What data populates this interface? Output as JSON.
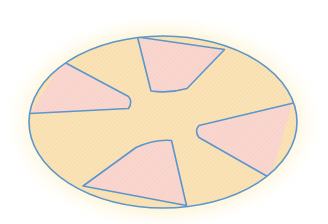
{
  "figure": {
    "title": "Ellipse divided into five pink sectors",
    "background_color": "#ffffff",
    "glow_color": "#fdf0c4",
    "stroke_color": "#5b96cc",
    "stroke_width": 1.6,
    "disk_fill": "#fae3b6",
    "sector_fill": "#fad6d2",
    "hatch_color": "#f3cf9a",
    "hatch_angle_deg": 45
  },
  "ellipse": {
    "label": "outer-ellipse",
    "cx": 163,
    "cy": 122,
    "rx": 134,
    "ry": 86,
    "left": 29,
    "right": 297,
    "top": 36,
    "bottom": 208
  },
  "hub": {
    "label": "central-hub",
    "description": "open yellow region at center where sector apexes stop",
    "approx_radius": 38
  },
  "sectors": [
    {
      "name": "sector-top",
      "fill": "#fad6d2",
      "arc_start_deg": 255,
      "arc_end_deg": 293,
      "apex": [
        168,
        92
      ],
      "points": "138,39 151,91 186,89 224,50"
    },
    {
      "name": "sector-upper-left",
      "fill": "#fad6d2",
      "arc_start_deg": 162,
      "arc_end_deg": 208,
      "apex": [
        128,
        101
      ],
      "points": "63,62 128,97 129,107 31,113"
    },
    {
      "name": "sector-right",
      "fill": "#fad6d2",
      "arc_start_deg": 340,
      "arc_end_deg": 58,
      "apex": [
        199,
        130
      ],
      "points": "292,103 199,126 198,136 270,177"
    },
    {
      "name": "sector-bottom",
      "fill": "#fad6d2",
      "arc_start_deg": 78,
      "arc_end_deg": 122,
      "apex": [
        154,
        142
      ],
      "points": "136,147 171,140 185,203 85,186"
    },
    {
      "name": "sector-upper-right-gap",
      "fill": "#fae3b6",
      "note": "yellow gap wedge between top and right sectors"
    }
  ],
  "chart_data": {
    "type": "pie",
    "categories": [
      "sector-top",
      "sector-upper-left",
      "sector-right",
      "sector-bottom",
      "gap-regions"
    ],
    "values": [
      14,
      16,
      18,
      16,
      36
    ],
    "colors": [
      "#fad6d2",
      "#fad6d2",
      "#fad6d2",
      "#fad6d2",
      "#fae3b6"
    ],
    "xlabel": "",
    "ylabel": "",
    "legend": "none",
    "grid": false
  }
}
